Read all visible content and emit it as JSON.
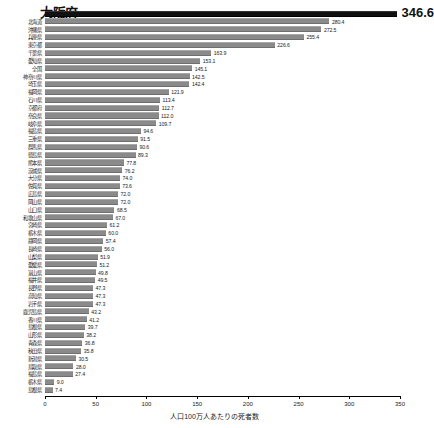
{
  "chart_data": {
    "type": "bar",
    "orientation": "horizontal",
    "title": "",
    "xlabel": "人口100万人あたりの死者数",
    "ylabel": "",
    "xlim": [
      0,
      350
    ],
    "xticks": [
      0,
      50,
      100,
      150,
      200,
      250,
      300,
      350
    ],
    "xtick_labels": [
      "0",
      "50",
      "100",
      "150",
      "200",
      "250",
      "300",
      "350"
    ],
    "grid": false,
    "legend": null,
    "highlight_index": 0,
    "highlight_color": "#111111",
    "bar_color": "#8a8a8a",
    "categories": [
      "大阪府",
      "北海道",
      "沖縄県",
      "兵庫県",
      "東京都",
      "千葉県",
      "愛知県",
      "全国",
      "神奈川県",
      "埼玉県",
      "福岡県",
      "石川県",
      "京都府",
      "奈良県",
      "岐阜県",
      "福島県",
      "三重県",
      "群馬県",
      "徳島県",
      "熊本県",
      "茨城県",
      "大分県",
      "佐賀県",
      "広島県",
      "岡山県",
      "山口県",
      "和歌山県",
      "宮崎県",
      "栃木県",
      "静岡県",
      "長崎県",
      "山梨県",
      "愛媛県",
      "富山県",
      "福井県",
      "長野県",
      "高知県",
      "岩手県",
      "鹿児島県",
      "香川県",
      "島根県",
      "山形県",
      "青森県",
      "秋田県",
      "新潟県",
      "鳥取県",
      "福島県"
    ],
    "values": [
      346.6,
      280.4,
      272.5,
      255.4,
      226.6,
      163.9,
      153.1,
      145.1,
      142.5,
      142.4,
      121.9,
      113.4,
      112.7,
      112.0,
      109.7,
      94.6,
      91.5,
      90.6,
      89.3,
      77.8,
      76.2,
      74.0,
      73.6,
      72.0,
      72.0,
      68.5,
      67.0,
      61.2,
      60.0,
      57.4,
      56.0,
      51.9,
      51.2,
      49.8,
      49.5,
      47.3,
      47.3,
      47.3,
      43.2,
      41.2,
      39.7,
      38.2,
      36.8,
      35.8,
      30.5,
      28.0,
      27.4
    ],
    "value_labels": [
      "346.6",
      "280.4",
      "272.5",
      "255.4",
      "226.6",
      "163.9",
      "153.1",
      "145.1",
      "142.5",
      "142.4",
      "121.9",
      "113.4",
      "112.7",
      "112.0",
      "109.7",
      "94.6",
      "91.5",
      "90.6",
      "89.3",
      "77.8",
      "76.2",
      "74.0",
      "73.6",
      "72.0",
      "72.0",
      "68.5",
      "67.0",
      "61.2",
      "60.0",
      "57.4",
      "56.0",
      "51.9",
      "51.2",
      "49.8",
      "49.5",
      "47.3",
      "47.3",
      "47.3",
      "43.2",
      "41.2",
      "39.7",
      "38.2",
      "36.8",
      "35.8",
      "30.5",
      "28.0",
      "27.4"
    ],
    "extra_rows": [
      {
        "label": "栃木県",
        "value": 9.0,
        "value_label": "9.0"
      },
      {
        "label": "島根県",
        "value": 7.4,
        "value_label": "7.4"
      }
    ]
  }
}
